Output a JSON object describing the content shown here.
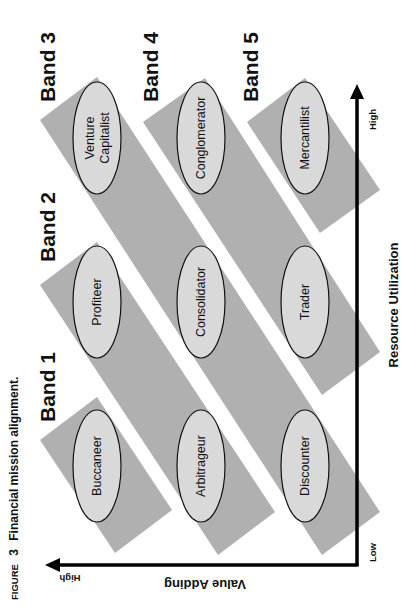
{
  "figure": {
    "title_prefix": "FIGURE",
    "title_number": "3",
    "title_text": "Financial mission alignment."
  },
  "colors": {
    "band_fill": "#b0b0b0",
    "ellipse_fill": "#d9d9d9",
    "stroke": "#111111",
    "axis": "#000000"
  },
  "bands": [
    {
      "label": "Band 1",
      "members": [
        "Buccaneer"
      ]
    },
    {
      "label": "Band 2",
      "members": [
        "Profiteer",
        "Arbitrageur"
      ]
    },
    {
      "label": "Band 3",
      "members": [
        "Venture Capitalist",
        "Consolidator",
        "Discounter"
      ]
    },
    {
      "label": "Band 4",
      "members": [
        "Conglomerator",
        "Trader"
      ]
    },
    {
      "label": "Band 5",
      "members": [
        "Mercantilist"
      ]
    }
  ],
  "nodes": {
    "venture_line1": "Venture",
    "venture_line2": "Capitalist",
    "conglomerator": "Conglomerator",
    "mercantilist": "Mercantilist",
    "profiteer": "Profiteer",
    "consolidator": "Consolidator",
    "trader": "Trader",
    "buccaneer": "Buccaneer",
    "arbitrageur": "Arbitrageur",
    "discounter": "Discounter"
  },
  "axes": {
    "x_title": "Resource Utilization",
    "x_low": "Low",
    "x_high": "High",
    "y_title": "Value Adding",
    "y_high": "High"
  },
  "grid": {
    "rows": [
      "High resource utilization",
      "Medium resource utilization",
      "Low resource utilization"
    ],
    "cols": [
      "High value adding",
      "Medium value adding",
      "Low value adding"
    ],
    "cells": [
      [
        "Venture Capitalist",
        "Conglomerator",
        "Mercantilist"
      ],
      [
        "Profiteer",
        "Consolidator",
        "Trader"
      ],
      [
        "Buccaneer",
        "Arbitrageur",
        "Discounter"
      ]
    ]
  }
}
